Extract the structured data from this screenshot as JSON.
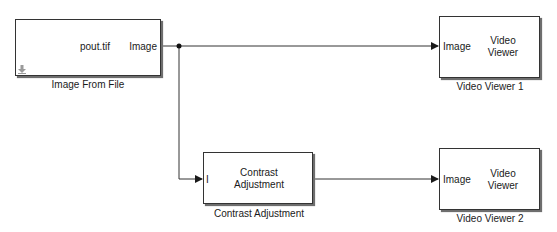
{
  "model": {
    "blocks": {
      "image_from_file": {
        "content": "pout.tif",
        "output_port": "Image",
        "caption": "Image From File",
        "icon": "source-arrow-icon"
      },
      "video_viewer_1": {
        "input_port": "Image",
        "content_line1": "Video",
        "content_line2": "Viewer",
        "caption": "Video Viewer 1"
      },
      "contrast_adjustment": {
        "input_port": "I",
        "content_line1": "Contrast",
        "content_line2": "Adjustment",
        "caption": "Contrast Adjustment"
      },
      "video_viewer_2": {
        "input_port": "Image",
        "content_line1": "Video",
        "content_line2": "Viewer",
        "caption": "Video Viewer 2"
      }
    },
    "colors": {
      "wire": "#333333",
      "block_border": "#333333",
      "shadow": "#6e6e6e",
      "icon": "#9a9a9a"
    }
  }
}
